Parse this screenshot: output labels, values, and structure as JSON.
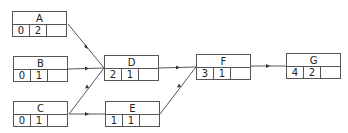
{
  "diagram": {
    "type": "activity-on-node network",
    "nodes": [
      {
        "id": "A",
        "label": "A",
        "values": [
          "0",
          "2",
          ""
        ],
        "x": 12,
        "y": 11
      },
      {
        "id": "B",
        "label": "B",
        "values": [
          "0",
          "1",
          ""
        ],
        "x": 13,
        "y": 56
      },
      {
        "id": "C",
        "label": "C",
        "values": [
          "0",
          "1",
          ""
        ],
        "x": 13,
        "y": 101
      },
      {
        "id": "D",
        "label": "D",
        "values": [
          "2",
          "1",
          ""
        ],
        "x": 104,
        "y": 55
      },
      {
        "id": "E",
        "label": "E",
        "values": [
          "1",
          "1",
          ""
        ],
        "x": 105,
        "y": 101
      },
      {
        "id": "F",
        "label": "F",
        "values": [
          "3",
          "1",
          ""
        ],
        "x": 196,
        "y": 54
      },
      {
        "id": "G",
        "label": "G",
        "values": [
          "4",
          "2",
          ""
        ],
        "x": 286,
        "y": 53
      }
    ],
    "edges": [
      {
        "from": "A",
        "to": "D"
      },
      {
        "from": "B",
        "to": "D"
      },
      {
        "from": "C",
        "to": "D"
      },
      {
        "from": "C",
        "to": "E"
      },
      {
        "from": "D",
        "to": "F"
      },
      {
        "from": "E",
        "to": "F"
      },
      {
        "from": "F",
        "to": "G"
      }
    ]
  },
  "colors": {
    "line": "#555555",
    "background": "#ffffff",
    "text": "#222222"
  }
}
